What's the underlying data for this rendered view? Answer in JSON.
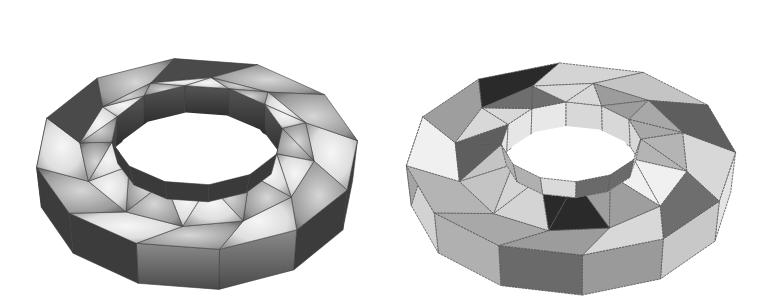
{
  "figures": [
    {
      "id": "left",
      "label": "smooth-shaded polyhedral torus",
      "shading": "gouraud",
      "segments": 12,
      "center": [
        197,
        158
      ],
      "outer": {
        "rx": 162,
        "ry": 112,
        "depth": 40
      },
      "tube_inner": {
        "rx": 118,
        "ry": 75
      },
      "hole": {
        "rx": 86,
        "ry": 50,
        "wall": 32
      },
      "rotation_deg": -8,
      "colors": {
        "top_light": "#f2f2f2",
        "top_mid": "#b8b8b8",
        "top_dark": "#555555",
        "side_light": "#9a9a9a",
        "side_dark": "#2e2e2e",
        "inner_wall_dark": "#3a3a3a",
        "inner_wall_mid": "#6a6a6a",
        "hole": "#ffffff"
      }
    },
    {
      "id": "right",
      "label": "flat-shaded colored polyhedral torus",
      "shading": "flat",
      "segments": 12,
      "center": [
        188,
        163
      ],
      "outer": {
        "rx": 165,
        "ry": 112,
        "depth": 40
      },
      "tube_inner": {
        "rx": 118,
        "ry": 75
      },
      "hole": {
        "rx": 70,
        "ry": 40,
        "wall": 28
      },
      "rotation_deg": -4,
      "colors": {
        "palette": [
          "#d8d8d8",
          "#6e6e6e",
          "#d8d8d8",
          "#9c9c9c",
          "#a8a8a8",
          "#b4b4b4",
          "#f0f0f0",
          "#9e9e9e",
          "#2a2a2a",
          "#d4d4d4",
          "#c4c4c4",
          "#5e5e5e"
        ],
        "outer_side_palette": [
          "#e4e4e4",
          "#c8c8c8",
          "#9a9a9a",
          "#6a6a6a",
          "#b0b0b0",
          "#d2d2d2",
          "#a4a4a4",
          "#c0c0c0",
          "#cfcfcf",
          "#a8a8a8",
          "#7a7a7a",
          "#d6d6d6"
        ],
        "inner_wall_palette": [
          "#d8d8d8",
          "#6a6a6a",
          "#6a6a6a",
          "#dadada",
          "#b0b0b0",
          "#b0b0b0",
          "#e6e6e6",
          "#e6e6e6",
          "#e8e8e8",
          "#d8d8d8",
          "#d8d8d8",
          "#d8d8d8"
        ],
        "hole": "#ffffff",
        "edge": "#555555"
      }
    }
  ]
}
